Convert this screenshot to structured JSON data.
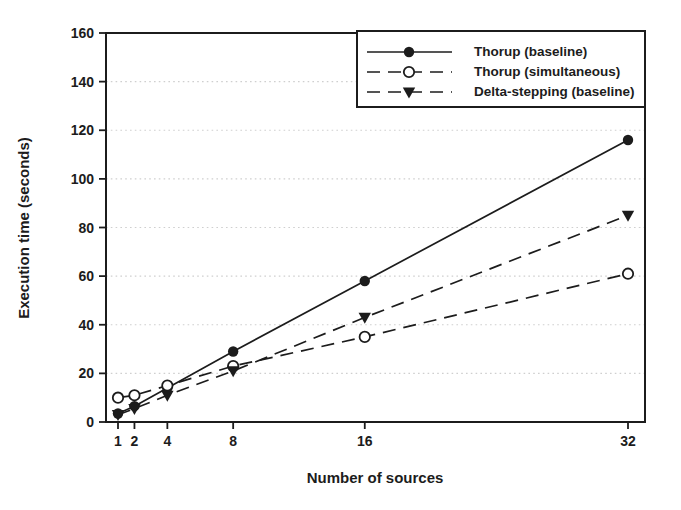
{
  "chart_data": {
    "type": "line",
    "title": "",
    "xlabel": "Number of sources",
    "ylabel": "Execution time (seconds)",
    "x": [
      1,
      2,
      4,
      8,
      16,
      32
    ],
    "x_tick_labels": [
      "1",
      "2",
      "4",
      "8",
      "16",
      "32"
    ],
    "xlim": [
      1,
      32
    ],
    "ylim": [
      0,
      160
    ],
    "y_ticks": [
      0,
      20,
      40,
      60,
      80,
      100,
      120,
      140,
      160
    ],
    "grid": "horizontal-dotted",
    "legend_position": "top-right-inside",
    "series": [
      {
        "name": "Thorup (baseline)",
        "line_style": "solid",
        "marker": "filled-circle",
        "values": [
          3.5,
          6.5,
          14,
          29,
          58,
          116
        ]
      },
      {
        "name": "Thorup (simultaneous)",
        "line_style": "dashed",
        "marker": "open-circle",
        "values": [
          10,
          11,
          15,
          23,
          35,
          61
        ]
      },
      {
        "name": "Delta-stepping (baseline)",
        "line_style": "dashed",
        "marker": "filled-triangle-down",
        "values": [
          3,
          5.5,
          11,
          21,
          43,
          85
        ]
      }
    ]
  },
  "colors": {
    "ink": "#1c1c1c",
    "grid": "#cfcfcf",
    "background": "#ffffff"
  }
}
